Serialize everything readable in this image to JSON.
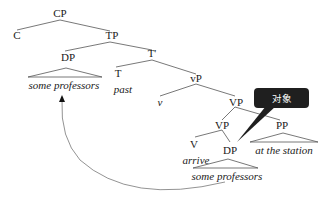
{
  "diagram": {
    "type": "syntax-tree",
    "nodes": {
      "cp": "CP",
      "c": "C",
      "tp": "TP",
      "dp_spec": "DP",
      "dp_spec_leaf": "some professors",
      "t_bar": "T'",
      "t": "T",
      "t_leaf": "past",
      "little_vp": "vP",
      "little_v": "v",
      "vp_upper": "VP",
      "vp_lower": "VP",
      "pp": "PP",
      "pp_leaf": "at the station",
      "v": "V",
      "v_leaf": "arrive",
      "dp_obj": "DP",
      "dp_obj_leaf": "some professors"
    },
    "movement_arrow": {
      "from": "dp_obj",
      "to": "dp_spec"
    }
  },
  "tooltip": {
    "label": "对象",
    "background": "#1f1f1f",
    "target": "dp_obj"
  }
}
